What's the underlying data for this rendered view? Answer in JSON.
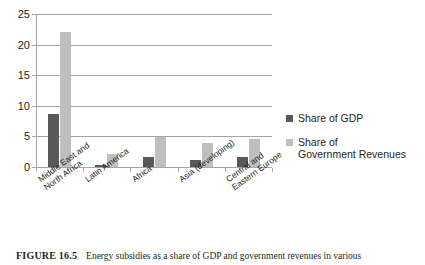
{
  "chart_data": {
    "type": "bar",
    "title": "",
    "xlabel": "",
    "ylabel": "",
    "ylim": [
      0,
      25
    ],
    "yticks": [
      0,
      5,
      10,
      15,
      20,
      25
    ],
    "grid": true,
    "legend_position": "right",
    "categories": [
      "Middle East and\nNorth Africa",
      "Latin America",
      "Africa",
      "Asia (developing)",
      "Central and\nEastern Europe"
    ],
    "series": [
      {
        "name": "Share of GDP",
        "color": "#595959",
        "values": [
          8.6,
          0.4,
          1.6,
          1.1,
          1.6
        ]
      },
      {
        "name": "Share of\nGovernment Revenues",
        "color": "#bfbfbf",
        "values": [
          22.0,
          2.2,
          4.9,
          4.0,
          4.6
        ]
      }
    ]
  },
  "legend": {
    "items": [
      {
        "label": "Share of GDP",
        "color": "#595959"
      },
      {
        "label": "Share of\nGovernment Revenues",
        "color": "#bfbfbf"
      }
    ]
  },
  "caption": {
    "label": "FIGURE 16.5",
    "text": "Energy subsidies as a share of GDP and government revenues in various"
  },
  "colors": {
    "axis": "#a6a6a6",
    "grid": "#a6a6a6",
    "text": "#231f20",
    "series_dark": "#595959",
    "series_light": "#bfbfbf"
  }
}
